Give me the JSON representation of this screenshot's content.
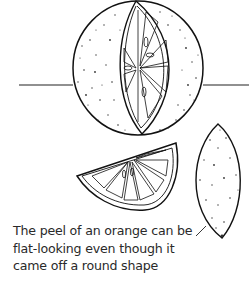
{
  "figure": {
    "caption_lines": [
      "The peel of an orange can be",
      "flat-looking even though it",
      "came off a round shape"
    ],
    "elements": [
      "whole-orange-with-segment",
      "horizon-line",
      "orange-wedge",
      "flat-peel-piece",
      "pointer-line"
    ]
  },
  "colors": {
    "ink": "#1a1a1a",
    "paper": "#ffffff"
  }
}
